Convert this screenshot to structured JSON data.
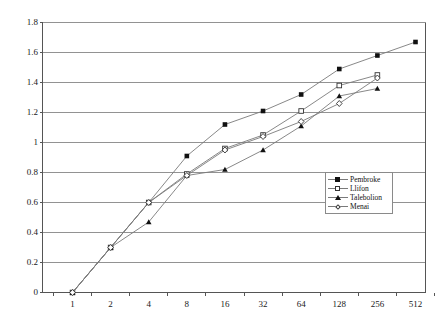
{
  "chart_data": {
    "type": "line",
    "title": "",
    "xlabel": "",
    "ylabel": "",
    "grid": "horizontal",
    "legend_position": "inside-right",
    "x_scale": "log2-categorical",
    "categories": [
      "1",
      "2",
      "4",
      "8",
      "16",
      "32",
      "64",
      "128",
      "256",
      "512"
    ],
    "x_tick_labels": [
      "1",
      "2",
      "4",
      "8",
      "16",
      "32",
      "64",
      "128",
      "256",
      "512"
    ],
    "y_tick_labels": [
      "0",
      "0.2",
      "0.4",
      "0.6",
      "0.8",
      "1",
      "1.2",
      "1.4",
      "1.6",
      "1.8"
    ],
    "ylim": [
      0,
      1.8
    ],
    "y_step": 0.2,
    "series": [
      {
        "name": "Pembroke",
        "marker": "filled-square",
        "values": [
          0,
          0.3,
          0.6,
          0.91,
          1.12,
          1.21,
          1.32,
          1.49,
          1.58,
          1.67
        ]
      },
      {
        "name": "Llifon",
        "marker": "open-square",
        "values": [
          0,
          0.3,
          0.6,
          0.79,
          0.96,
          1.05,
          1.21,
          1.38,
          1.45,
          null
        ]
      },
      {
        "name": "Talebolion",
        "marker": "filled-triangle",
        "values": [
          0,
          0.3,
          0.47,
          0.78,
          0.82,
          0.95,
          1.11,
          1.31,
          1.36,
          null
        ]
      },
      {
        "name": "Menai",
        "marker": "open-diamond",
        "values": [
          0,
          0.3,
          0.6,
          0.78,
          0.95,
          1.04,
          1.14,
          1.26,
          1.43,
          null
        ]
      }
    ],
    "colors": {
      "line": "#7a7a7a",
      "grid": "#808080",
      "axis": "#555555",
      "marker": "#111111",
      "background": "#ffffff"
    }
  }
}
